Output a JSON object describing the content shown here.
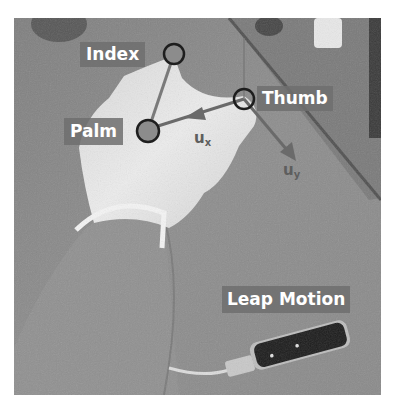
{
  "figure": {
    "colors": {
      "background": "#ffffff",
      "photo_base": "#8a8a8a",
      "glove": "#e6e6e6",
      "label_bg": "#6e6e6e",
      "label_text": "#ffffff",
      "marker_ring": "#1e1e1e",
      "marker_fill": "#8c8c8c",
      "vector": "#6a6a6a",
      "device": "#1c1c1c"
    }
  },
  "keypoints": [
    {
      "id": "index",
      "label": "Index",
      "x": 174,
      "y": 54
    },
    {
      "id": "palm",
      "label": "Palm",
      "x": 148,
      "y": 131
    },
    {
      "id": "thumb",
      "label": "Thumb",
      "x": 244,
      "y": 99
    }
  ],
  "vectors": [
    {
      "id": "ux",
      "symbol": "u",
      "subscript": "x"
    },
    {
      "id": "uy",
      "symbol": "u",
      "subscript": "y"
    }
  ],
  "device": {
    "label": "Leap Motion"
  }
}
